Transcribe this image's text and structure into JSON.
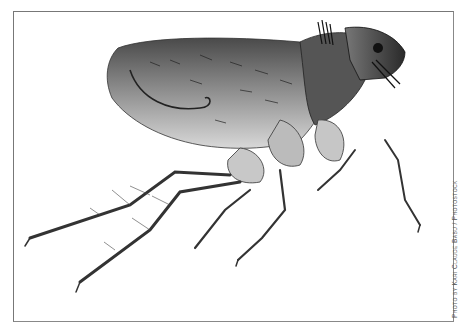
{
  "image": {
    "subject": "Flea (micrograph, side view)",
    "background_color": "#ffffff",
    "frame_color": "#777777"
  },
  "credit": {
    "text": "Photo by Kari Claude Babu / Photostock"
  }
}
